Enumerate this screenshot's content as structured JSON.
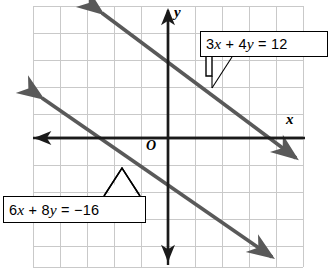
{
  "figure": {
    "axes": {
      "x_label": "x",
      "y_label": "y",
      "origin_label": "O"
    },
    "callouts": [
      {
        "id": "upper",
        "text": "3x + 4y = 12"
      },
      {
        "id": "lower",
        "text": "6x + 8y = −16"
      }
    ],
    "colors": {
      "grid": "#c9c9c9",
      "axis": "#1a1a1a",
      "line": "#595959",
      "background": "#ffffff",
      "callout_border": "#000000"
    }
  },
  "chart_data": {
    "type": "line",
    "title": "",
    "xlabel": "x",
    "ylabel": "y",
    "grid": true,
    "legend": "none",
    "xlim": [
      -5,
      5
    ],
    "ylim": [
      -4.6,
      4.9
    ],
    "annotations": [
      {
        "text": "3x + 4y = 12",
        "points_to_line": "3x + 4y = 12"
      },
      {
        "text": "6x + 8y = −16",
        "points_to_line": "6x + 8y = −16"
      },
      {
        "text": "O",
        "note": "origin marker"
      }
    ],
    "series": [
      {
        "name": "3x + 4y = 12",
        "equation": "3x + 4y = 12",
        "slope": -0.75,
        "y_intercept": 3,
        "x_intercept": 4,
        "points": [
          [
            -4,
            6
          ],
          [
            0,
            3
          ],
          [
            4,
            0
          ]
        ],
        "arrows": "both"
      },
      {
        "name": "6x + 8y = −16",
        "equation": "6x + 8y = −16",
        "slope": -0.75,
        "y_intercept": -2,
        "x_intercept": 2.6667,
        "points": [
          [
            -5,
            1.75
          ],
          [
            0,
            -2
          ],
          [
            4,
            -5
          ]
        ],
        "arrows": "both"
      }
    ]
  }
}
